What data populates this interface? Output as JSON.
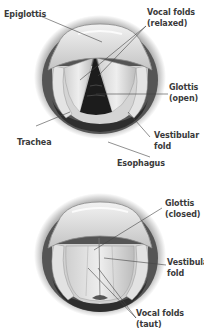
{
  "diagram": {
    "top": {
      "title": "Larynx with glottis open",
      "labels": {
        "epiglottis": "Epiglottis",
        "vocal_folds_1": "Vocal folds",
        "vocal_folds_2": "(relaxed)",
        "glottis_1": "Glottis",
        "glottis_2": "(open)",
        "trachea": "Trachea",
        "vestibular_1": "Vestibular",
        "vestibular_2": "fold",
        "esophagus": "Esophagus"
      }
    },
    "bottom": {
      "title": "Larynx with glottis closed",
      "labels": {
        "glottis_1": "Glottis",
        "glottis_2": "(closed)",
        "vestibular_1": "Vestibular",
        "vestibular_2": "fold",
        "vocal_folds_1": "Vocal folds",
        "vocal_folds_2": "(taut)"
      }
    },
    "colors": {
      "tissue_light": "#e6e6e6",
      "tissue_mid": "#a8a8a8",
      "tissue_dark": "#3a3a3a",
      "label_text": "#3a3a3a",
      "leader_line": "#444444"
    }
  }
}
